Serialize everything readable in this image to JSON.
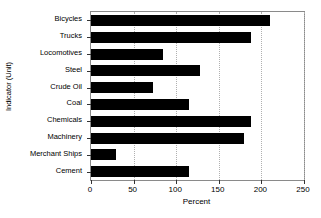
{
  "chart_data": {
    "type": "bar",
    "orientation": "horizontal",
    "title": "",
    "xlabel": "Percent",
    "ylabel": "Indicator (Unit)",
    "categories": [
      "Bicycles",
      "Trucks",
      "Locomotives",
      "Steel",
      "Crude Oil",
      "Coal",
      "Chemicals",
      "Machinery",
      "Merchant Ships",
      "Cement"
    ],
    "values": [
      210,
      188,
      85,
      128,
      73,
      115,
      188,
      180,
      29,
      115
    ],
    "xlim": [
      0,
      250
    ],
    "xticks": [
      0,
      50,
      100,
      150,
      200,
      250
    ],
    "xtick_labels": [
      "0",
      "50",
      "100",
      "150",
      "200",
      "250"
    ],
    "grid": "vertical-dotted",
    "legend": "none",
    "bar_color": "#000000",
    "grid_color": "#b0b0b0",
    "axis_color": "#8a8a8a"
  }
}
